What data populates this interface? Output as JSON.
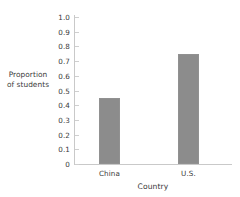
{
  "chart_data": {
    "type": "bar",
    "title": "",
    "categories": [
      "China",
      "U.S."
    ],
    "values": [
      0.45,
      0.75
    ],
    "series": [
      {
        "name": "Proportion of students",
        "values": [
          0.45,
          0.75
        ]
      }
    ],
    "xlabel": "Country",
    "ylabel": "Proportion of students",
    "ylabel_lines": [
      "Proportion",
      "of students"
    ],
    "ylim": [
      0,
      1.0
    ],
    "ytick_labels": [
      "1.0",
      "0.9",
      "0.8",
      "0.7",
      "0.6",
      "0.5",
      "0.4",
      "0.3",
      "0.2",
      "0.1",
      "0"
    ],
    "ytick_values": [
      1.0,
      0.9,
      0.8,
      0.7,
      0.6,
      0.5,
      0.4,
      0.3,
      0.2,
      0.1,
      0
    ],
    "grid": false,
    "legend": "none",
    "bar_color": "#8c8c8c",
    "axis_color": "#c9c9c9",
    "text_color": "#3a3a3a",
    "background_color": "#ffffff"
  }
}
